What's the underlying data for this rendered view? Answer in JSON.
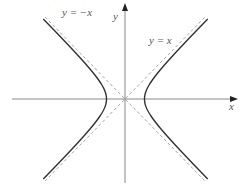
{
  "diagram": {
    "axes": {
      "x_label": "x",
      "y_label": "y"
    },
    "asymptotes": [
      {
        "label": "y = −x",
        "style": "dashed"
      },
      {
        "label": "y = x",
        "style": "dashed"
      }
    ],
    "curve": {
      "name": "hyperbola",
      "branches": 2,
      "style": "solid"
    },
    "colors": {
      "axis": "#888888",
      "curve": "#333333",
      "asymptote": "#999999",
      "text": "#555555"
    }
  }
}
